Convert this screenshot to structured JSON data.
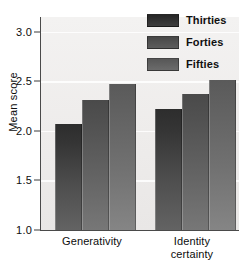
{
  "chart_data": {
    "type": "bar",
    "title": "",
    "xlabel": "",
    "ylabel": "Mean score",
    "categories": [
      "Generativity",
      "Identity certainty"
    ],
    "category_lines": [
      [
        "Generativity"
      ],
      [
        "Identity",
        "certainty"
      ]
    ],
    "series": [
      {
        "name": "Thirties",
        "values": [
          2.07,
          2.22
        ],
        "color": "#303030"
      },
      {
        "name": "Forties",
        "values": [
          2.31,
          2.37
        ],
        "color": "#505050"
      },
      {
        "name": "Fifties",
        "values": [
          2.47,
          2.51
        ],
        "color": "#5f5f5f"
      }
    ],
    "ylim": [
      1.0,
      3.15
    ],
    "yticks": [
      1.0,
      1.5,
      2.0,
      2.5,
      3.0
    ],
    "ytick_labels": [
      "1.0",
      "1.5",
      "2.0",
      "2.5",
      "3.0"
    ],
    "grid": true,
    "grid_color": "#fdfdfd",
    "legend_position": "top-right",
    "plot_background": "#efeeed",
    "axis_color": "#4a4a4a",
    "text_color": "#0d0d0d"
  },
  "axes": {
    "y_title": "Mean score"
  },
  "legend": {
    "entries": [
      {
        "label": "Thirties"
      },
      {
        "label": "Forties"
      },
      {
        "label": "Fifties"
      }
    ]
  }
}
